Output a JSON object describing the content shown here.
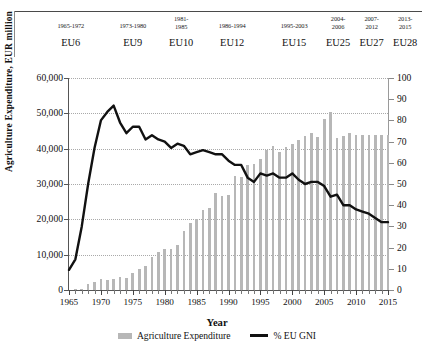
{
  "header": {
    "columns": [
      {
        "period": "1965-1972",
        "name": "EU6"
      },
      {
        "period": "1973-1980",
        "name": "EU9"
      },
      {
        "period": "1981-\n1985",
        "name": "EU10"
      },
      {
        "period": "1986-1994",
        "name": "EU12"
      },
      {
        "period": "1995-2003",
        "name": "EU15"
      },
      {
        "period": "2004-\n2006",
        "name": "EU25"
      },
      {
        "period": "2007-\n2012",
        "name": "EU27"
      },
      {
        "period": "2013-\n2015",
        "name": "EU28"
      }
    ]
  },
  "chart_data": {
    "type": "bar",
    "title": "",
    "xlabel": "Year",
    "ylabel": "Agriculture Expenditure, EUR million",
    "ylabel_right": "",
    "xlim": [
      1965,
      2015
    ],
    "ylim": [
      0,
      60000
    ],
    "ylim_right": [
      0,
      100
    ],
    "grid": true,
    "legend_position": "bottom",
    "x_ticks": [
      1965,
      1970,
      1975,
      1980,
      1985,
      1990,
      1995,
      2000,
      2005,
      2010,
      2015
    ],
    "y_ticks_left": [
      "0",
      "10,000",
      "20,000",
      "30,000",
      "40,000",
      "50,000",
      "60,000"
    ],
    "y_ticks_right": [
      "0",
      "10",
      "20",
      "30",
      "40",
      "50",
      "60",
      "70",
      "80",
      "90",
      "100"
    ],
    "x": [
      1965,
      1966,
      1967,
      1968,
      1969,
      1970,
      1971,
      1972,
      1973,
      1974,
      1975,
      1976,
      1977,
      1978,
      1979,
      1980,
      1981,
      1982,
      1983,
      1984,
      1985,
      1986,
      1987,
      1988,
      1989,
      1990,
      1991,
      1992,
      1993,
      1994,
      1995,
      1996,
      1997,
      1998,
      1999,
      2000,
      2001,
      2002,
      2003,
      2004,
      2005,
      2006,
      2007,
      2008,
      2009,
      2010,
      2011,
      2012,
      2013,
      2014,
      2015
    ],
    "series": [
      {
        "name": "Agriculture Expenditure",
        "axis": "left",
        "type": "bar",
        "color": "#b7b7b7",
        "values": [
          120,
          180,
          250,
          1700,
          2400,
          3100,
          2900,
          3000,
          3600,
          3400,
          4800,
          6000,
          6900,
          9300,
          10800,
          11600,
          11500,
          12800,
          16600,
          19000,
          20000,
          22700,
          23300,
          27500,
          26500,
          26800,
          32400,
          32000,
          35400,
          35600,
          37000,
          39500,
          40900,
          39000,
          40500,
          41300,
          42500,
          43500,
          44400,
          43400,
          48500,
          50500,
          43000,
          43500,
          44500,
          44000,
          44000,
          44000,
          44000,
          44000,
          44000
        ]
      },
      {
        "name": "% EU GNI",
        "axis": "right",
        "type": "line",
        "color": "#111111",
        "values": [
          9.5,
          14.5,
          30,
          50,
          67,
          80,
          84,
          87,
          79,
          74,
          77,
          77,
          71,
          73,
          71,
          70,
          67,
          69,
          68,
          64,
          65,
          66,
          65,
          64,
          64,
          61,
          59,
          59,
          53,
          51,
          55,
          54,
          55,
          53,
          53,
          55,
          52,
          50,
          51,
          51,
          49,
          44,
          45,
          40,
          40,
          38,
          37,
          36,
          34,
          32,
          32
        ]
      }
    ],
    "legend": [
      {
        "label": "Agriculture Expenditure",
        "marker": "bar",
        "color": "#b7b7b7"
      },
      {
        "label": "% EU GNI",
        "marker": "line",
        "color": "#111111"
      }
    ]
  }
}
